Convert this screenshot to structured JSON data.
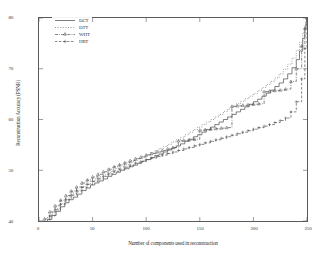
{
  "chart_data": {
    "type": "line",
    "title": "",
    "xlabel": "Number of components used in reconstruction",
    "ylabel": "Reconstruction Accuracy (PSNR)",
    "xlim": [
      0,
      250
    ],
    "ylim": [
      40,
      80
    ],
    "xticks": [
      0,
      50,
      100,
      150,
      200,
      250
    ],
    "xtick_labels": [
      "0",
      "50",
      "100",
      "150",
      "200",
      "250"
    ],
    "yticks": [
      40,
      50,
      60,
      70,
      80
    ],
    "ytick_labels": [
      "40",
      "50",
      "60",
      "70",
      "80"
    ],
    "grid": false,
    "legend_position": "upper left",
    "series": [
      {
        "name": "DCT",
        "linestyle": "solid",
        "marker": "none",
        "color": "#4a4a4a",
        "x": [
          0,
          4,
          8,
          12,
          16,
          20,
          24,
          28,
          32,
          36,
          40,
          44,
          48,
          52,
          56,
          60,
          64,
          68,
          72,
          76,
          80,
          84,
          88,
          92,
          96,
          100,
          104,
          108,
          112,
          116,
          120,
          124,
          128,
          132,
          136,
          140,
          144,
          148,
          152,
          156,
          160,
          164,
          168,
          172,
          176,
          180,
          184,
          188,
          192,
          196,
          200,
          204,
          208,
          212,
          216,
          220,
          224,
          228,
          232,
          236,
          240,
          243,
          246,
          248,
          249,
          250
        ],
        "y": [
          38.2,
          39.2,
          40.3,
          41.1,
          41.9,
          42.8,
          43.6,
          44.2,
          44.7,
          45.3,
          46.0,
          46.5,
          47.1,
          47.5,
          47.9,
          48.3,
          48.8,
          49.2,
          49.6,
          50.0,
          50.3,
          50.7,
          51.0,
          51.4,
          51.8,
          52.1,
          52.5,
          52.9,
          53.2,
          53.6,
          54.0,
          54.4,
          54.8,
          55.2,
          55.7,
          56.1,
          56.6,
          57.0,
          57.5,
          58.0,
          58.5,
          59.0,
          59.5,
          60.0,
          60.5,
          61.0,
          61.5,
          62.0,
          62.5,
          63.0,
          63.5,
          64.0,
          64.6,
          65.2,
          65.8,
          66.5,
          67.2,
          68.0,
          69.0,
          70.2,
          71.8,
          73.5,
          76.0,
          78.0,
          79.2,
          80.0
        ]
      },
      {
        "name": "DTT",
        "linestyle": "dotted",
        "marker": "none",
        "color": "#6a6a6a",
        "x": [
          0,
          4,
          8,
          12,
          16,
          20,
          24,
          28,
          32,
          36,
          40,
          44,
          48,
          52,
          56,
          60,
          64,
          68,
          72,
          76,
          80,
          84,
          88,
          92,
          96,
          100,
          104,
          108,
          112,
          116,
          120,
          124,
          128,
          132,
          136,
          140,
          144,
          148,
          152,
          156,
          160,
          164,
          168,
          172,
          176,
          180,
          184,
          188,
          192,
          196,
          200,
          204,
          208,
          212,
          216,
          220,
          224,
          228,
          232,
          236,
          240,
          243,
          246,
          248,
          249,
          250
        ],
        "y": [
          38.5,
          39.6,
          40.8,
          41.6,
          42.5,
          43.4,
          44.2,
          44.9,
          45.5,
          46.1,
          46.8,
          47.3,
          47.9,
          48.3,
          48.7,
          49.1,
          49.6,
          50.0,
          50.4,
          50.8,
          51.1,
          51.5,
          51.9,
          52.3,
          52.7,
          53.1,
          53.5,
          53.9,
          54.3,
          54.7,
          55.1,
          55.6,
          56.0,
          56.5,
          57.0,
          57.5,
          58.0,
          58.5,
          59.0,
          59.5,
          60.0,
          60.5,
          61.0,
          61.6,
          62.1,
          62.6,
          63.1,
          63.6,
          64.1,
          64.6,
          65.1,
          65.7,
          66.3,
          66.9,
          67.5,
          68.2,
          69.0,
          69.9,
          70.9,
          72.1,
          73.6,
          75.2,
          77.2,
          78.6,
          79.5,
          80.0
        ]
      },
      {
        "name": "WHT",
        "linestyle": "dashdot",
        "marker": "triangle",
        "color": "#555555",
        "x": [
          0,
          5,
          10,
          15,
          20,
          25,
          30,
          35,
          40,
          45,
          50,
          55,
          60,
          65,
          70,
          75,
          80,
          85,
          90,
          95,
          100,
          105,
          110,
          115,
          120,
          125,
          130,
          135,
          140,
          145,
          150,
          155,
          160,
          165,
          170,
          175,
          180,
          185,
          190,
          195,
          200,
          205,
          210,
          215,
          220,
          225,
          230,
          235,
          240,
          245,
          248,
          250
        ],
        "y": [
          38.8,
          40.4,
          41.8,
          43.0,
          44.1,
          45.0,
          45.9,
          46.7,
          47.5,
          48.1,
          48.7,
          49.2,
          49.7,
          50.2,
          50.7,
          51.1,
          51.5,
          51.9,
          52.3,
          52.6,
          53.0,
          53.3,
          53.6,
          53.9,
          54.2,
          54.5,
          55.8,
          55.9,
          56.0,
          56.1,
          57.9,
          58.0,
          58.1,
          58.2,
          58.3,
          58.4,
          62.6,
          62.7,
          62.8,
          62.9,
          63.0,
          63.1,
          65.5,
          65.6,
          65.7,
          65.8,
          66.0,
          67.5,
          70.0,
          74.5,
          78.0,
          80.0
        ]
      },
      {
        "name": "HRT",
        "linestyle": "dashed",
        "marker": "plus",
        "color": "#555555",
        "x": [
          0,
          5,
          10,
          15,
          20,
          25,
          30,
          35,
          40,
          45,
          50,
          55,
          60,
          65,
          70,
          75,
          80,
          85,
          90,
          95,
          100,
          105,
          110,
          115,
          120,
          125,
          130,
          135,
          140,
          145,
          150,
          155,
          160,
          165,
          170,
          175,
          180,
          185,
          190,
          195,
          200,
          205,
          210,
          215,
          220,
          225,
          230,
          235,
          240,
          245,
          248,
          250
        ],
        "y": [
          38.0,
          39.6,
          41.0,
          42.2,
          43.3,
          44.2,
          45.1,
          45.9,
          46.6,
          47.2,
          47.8,
          48.3,
          48.8,
          49.3,
          49.8,
          50.2,
          50.6,
          51.0,
          51.4,
          51.7,
          52.1,
          52.4,
          52.7,
          53.0,
          53.3,
          53.6,
          53.9,
          54.2,
          54.5,
          54.8,
          55.1,
          55.4,
          55.7,
          56.0,
          56.3,
          56.6,
          56.9,
          57.2,
          57.5,
          57.8,
          58.1,
          58.4,
          58.7,
          59.0,
          59.4,
          59.8,
          60.3,
          61.5,
          63.5,
          68.0,
          74.0,
          80.0
        ]
      }
    ]
  },
  "legend": {
    "entries": [
      {
        "label": "DCT"
      },
      {
        "label": "DTT"
      },
      {
        "label": "WHT"
      },
      {
        "label": "HRT"
      }
    ]
  }
}
